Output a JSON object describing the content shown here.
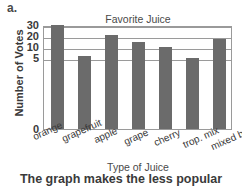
{
  "problem": {
    "label": "a."
  },
  "caption": {
    "text": "The graph makes the less popular"
  },
  "chart_data": {
    "type": "bar",
    "title": "Favorite Juice",
    "xlabel": "Type of Juice",
    "ylabel": "Number of Votes",
    "categories": [
      "orange",
      "grapefruit",
      "apple",
      "grape",
      "cherry",
      "trop. mix",
      "mixed berry"
    ],
    "values": [
      30,
      6,
      21,
      15,
      10,
      5,
      17
    ],
    "ytick_labels": [
      "30",
      "20",
      "10",
      "5",
      "0"
    ],
    "ytick_values": [
      30,
      20,
      10,
      5,
      0
    ],
    "ylim": [
      0,
      30
    ],
    "axis_scale": "non-linear",
    "axis_note": "Vertical scale is distorted: intervals 30-20, 20-10 and 10-5 occupy equal pixel spacing while 5-0 occupies a much larger gap.",
    "grid": true,
    "legend": "none",
    "bar_color": "#6b6b6b",
    "grid_color": "#9a9a9a",
    "background_color": "#ffffff"
  }
}
